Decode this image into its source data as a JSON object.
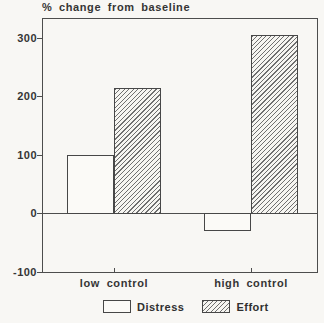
{
  "page": {
    "background": "#f8f7f4"
  },
  "chart_data": {
    "type": "bar",
    "title": "% change from baseline",
    "categories": [
      "low control",
      "high control"
    ],
    "series": [
      {
        "name": "Distress",
        "values": [
          100,
          -30
        ],
        "style": "open-white"
      },
      {
        "name": "Effort",
        "values": [
          215,
          305
        ],
        "style": "diagonal-hatch"
      }
    ],
    "xlabel": "",
    "ylabel": "% change from baseline",
    "y_ticks": [
      300,
      200,
      100,
      0,
      -100
    ],
    "y_tick_labels": [
      "300",
      "200",
      "100",
      "0",
      "-100"
    ],
    "ylim": [
      -100,
      332
    ],
    "baseline": 0,
    "grid": false,
    "legend_position": "bottom-center",
    "colors": {
      "outline": "#4d4d4d",
      "text": "#353535",
      "background": "#f8f7f4",
      "hatch_line": "#6f6f6f",
      "open_bar_fill": "#fbfaf7"
    }
  }
}
